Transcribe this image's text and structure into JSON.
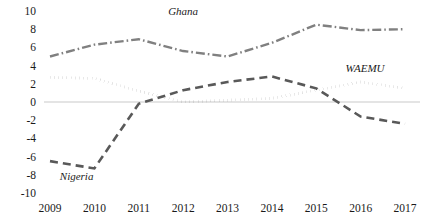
{
  "chart_data": {
    "type": "line",
    "title": "",
    "subtitle": "",
    "xlabel": "",
    "ylabel": "",
    "categories": [
      "2009",
      "2010",
      "2011",
      "2012",
      "2013",
      "2014",
      "2015",
      "2016",
      "2017"
    ],
    "x": [
      2009,
      2010,
      2011,
      2012,
      2013,
      2014,
      2015,
      2016,
      2017
    ],
    "ylim": [
      -10,
      10
    ],
    "yticks": [
      "10",
      "8",
      "6",
      "4",
      "2",
      "0",
      "-2",
      "-4",
      "-6",
      "-8",
      "-10"
    ],
    "ytick_values": [
      10,
      8,
      6,
      4,
      2,
      0,
      -2,
      -4,
      -6,
      -8,
      -10
    ],
    "grid": false,
    "zero_line": true,
    "legend": "inline-annotations",
    "series": [
      {
        "name": "Ghana",
        "style": "dash-dot",
        "color": "#808080",
        "values": [
          5.0,
          6.3,
          6.9,
          5.6,
          5.0,
          6.5,
          8.5,
          7.9,
          8.0
        ],
        "label_x": 2012.0,
        "label_y": 9.6
      },
      {
        "name": "WAEMU",
        "style": "dotted",
        "color": "#1a1a1a",
        "values": [
          2.7,
          2.6,
          1.2,
          0.0,
          0.2,
          0.4,
          1.3,
          2.2,
          1.5
        ],
        "label_x": 2016.1,
        "label_y": 3.3
      },
      {
        "name": "Nigeria",
        "style": "dashed",
        "color": "#595959",
        "values": [
          -6.5,
          -7.3,
          -0.2,
          1.3,
          2.2,
          2.8,
          1.5,
          -1.6,
          -2.4
        ],
        "label_x": 2009.6,
        "label_y": -8.6
      }
    ]
  },
  "axis": {
    "ytick_labels": [
      "10",
      "8",
      "6",
      "4",
      "2",
      "0",
      "-2",
      "-4",
      "-6",
      "-8",
      "-10"
    ],
    "xtick_labels": [
      "2009",
      "2010",
      "2011",
      "2012",
      "2013",
      "2014",
      "2015",
      "2016",
      "2017"
    ]
  },
  "annotations": {
    "ghana": "Ghana",
    "waemu": "WAEMU",
    "nigeria": "Nigeria"
  }
}
